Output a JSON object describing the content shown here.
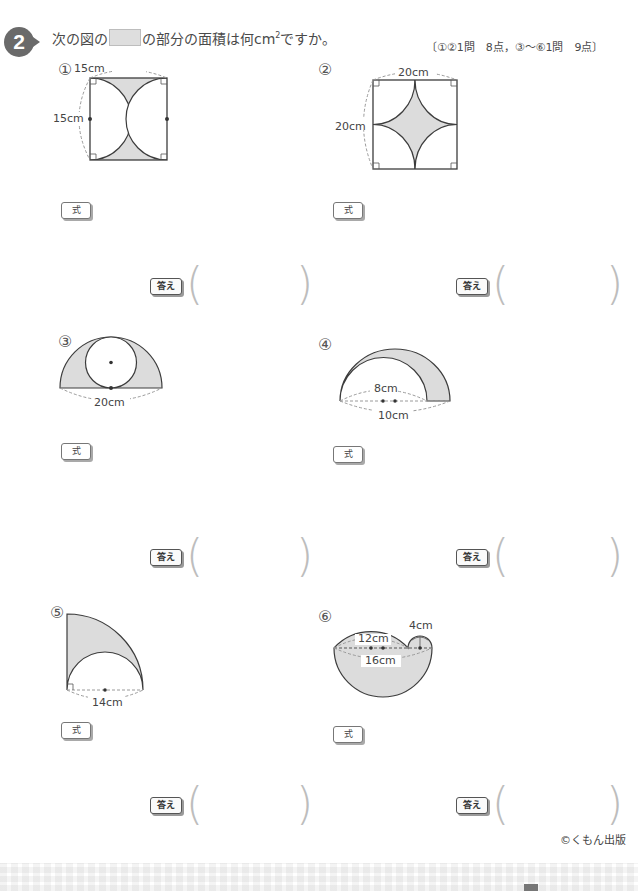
{
  "header": {
    "problem_number": "2",
    "instruction_pre": "次の図の",
    "instruction_post": "の部分の面積は何cm",
    "instruction_sup": "2",
    "instruction_end": "ですか。",
    "points": "〔①②1問　8点，③〜⑥1問　9点〕"
  },
  "problems": [
    {
      "num": "①",
      "labels": [
        "15cm",
        "15cm"
      ],
      "formula_label": "式",
      "answer_label": "答え",
      "answer_value": ""
    },
    {
      "num": "②",
      "labels": [
        "20cm",
        "20cm"
      ],
      "formula_label": "式",
      "answer_label": "答え",
      "answer_value": ""
    },
    {
      "num": "③",
      "labels": [
        "20cm"
      ],
      "formula_label": "式",
      "answer_label": "答え",
      "answer_value": ""
    },
    {
      "num": "④",
      "labels": [
        "8cm",
        "10cm"
      ],
      "formula_label": "式",
      "answer_label": "答え",
      "answer_value": ""
    },
    {
      "num": "⑤",
      "labels": [
        "14cm"
      ],
      "formula_label": "式",
      "answer_label": "答え",
      "answer_value": ""
    },
    {
      "num": "⑥",
      "labels": [
        "12cm",
        "16cm",
        "4cm"
      ],
      "formula_label": "式",
      "answer_label": "答え",
      "answer_value": ""
    }
  ],
  "parens": {
    "open": "(",
    "close": ")"
  },
  "footer": {
    "copyright": "©くもん出版"
  },
  "colors": {
    "shade": "#dcdcdc",
    "line": "#3c3c3c",
    "dash": "#9a9a9a"
  }
}
